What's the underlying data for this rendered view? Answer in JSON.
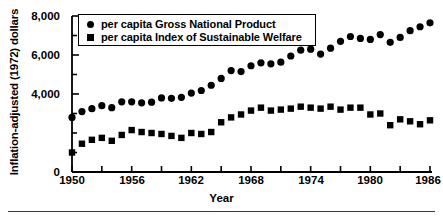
{
  "chart_data": {
    "type": "scatter",
    "title": "",
    "xlabel": "Year",
    "ylabel": "Inflation-adjusted (1972) dollars",
    "xlim": [
      1950,
      1986
    ],
    "ylim": [
      0,
      8000
    ],
    "grid": false,
    "legend_position": "top-left-inside",
    "y_ticks_major": [
      0,
      4000,
      6000,
      8000
    ],
    "y_tick_labels": [
      "0",
      "4,000",
      "6,000",
      "8,000"
    ],
    "y_ticks_minor": [
      1000,
      2000,
      3000,
      5000,
      7000
    ],
    "x_ticks_major": [
      1950,
      1956,
      1962,
      1968,
      1974,
      1980,
      1986
    ],
    "x_tick_labels": [
      "1950",
      "1956",
      "1962",
      "1968",
      "1974",
      "1980",
      "1986"
    ],
    "x_ticks_minor": [
      1953,
      1959,
      1965,
      1971,
      1977,
      1983
    ],
    "x": [
      1950,
      1951,
      1952,
      1953,
      1954,
      1955,
      1956,
      1957,
      1958,
      1959,
      1960,
      1961,
      1962,
      1963,
      1964,
      1965,
      1966,
      1967,
      1968,
      1969,
      1970,
      1971,
      1972,
      1973,
      1974,
      1975,
      1976,
      1977,
      1978,
      1979,
      1980,
      1981,
      1982,
      1983,
      1984,
      1985,
      1986
    ],
    "series": [
      {
        "name": "per capita Gross National Product",
        "marker": "circle",
        "color": "#000000",
        "values": [
          2800,
          3100,
          3250,
          3400,
          3300,
          3600,
          3600,
          3550,
          3580,
          3800,
          3780,
          3830,
          4050,
          4180,
          4450,
          4800,
          5200,
          5150,
          5450,
          5600,
          5550,
          5630,
          5950,
          6250,
          6300,
          6050,
          6350,
          6700,
          6950,
          6850,
          6800,
          7050,
          6650,
          6900,
          7250,
          7450,
          7650
        ]
      },
      {
        "name": "per capita Index of Sustainable Welfare",
        "marker": "square",
        "color": "#000000",
        "values": [
          1000,
          1450,
          1650,
          1750,
          1600,
          1900,
          2150,
          2050,
          2000,
          1950,
          1850,
          1750,
          2000,
          1950,
          2050,
          2550,
          2800,
          2950,
          3150,
          3300,
          3150,
          3200,
          3250,
          3350,
          3300,
          3250,
          3350,
          3200,
          3300,
          3300,
          2950,
          3000,
          2400,
          2700,
          2600,
          2450,
          2650
        ]
      }
    ]
  },
  "axis": {
    "ylabel": "Inflation-adjusted (1972) dollars",
    "xlabel": "Year"
  },
  "legend": {
    "entries": [
      {
        "label": "per capita Gross National Product",
        "marker": "circle-marker-icon"
      },
      {
        "label": "per capita Index of Sustainable Welfare",
        "marker": "square-marker-icon"
      }
    ]
  }
}
